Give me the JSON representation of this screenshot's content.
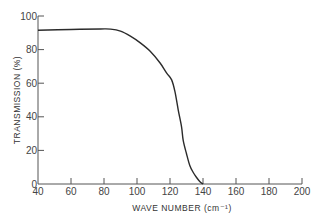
{
  "chart_data": {
    "type": "line",
    "title": "",
    "xlabel": "WAVE NUMBER (cm⁻¹)",
    "ylabel": "TRANSMISSION",
    "ylabel_unit": "(%)",
    "xlim": [
      40,
      200
    ],
    "ylim": [
      0,
      100
    ],
    "x_ticks": [
      40,
      60,
      80,
      100,
      120,
      140,
      160,
      180,
      200
    ],
    "y_ticks": [
      0,
      20,
      40,
      60,
      80,
      100
    ],
    "grid": false,
    "legend": null,
    "series": [
      {
        "name": "Transmission",
        "x": [
          40,
          60,
          78,
          84,
          90,
          96,
          102,
          108,
          114,
          118,
          121,
          123,
          125,
          127,
          128,
          130,
          132,
          134,
          136,
          138,
          140
        ],
        "values": [
          91.5,
          92,
          92.3,
          92.2,
          91,
          88,
          84,
          79,
          72,
          66,
          62,
          55,
          44,
          34,
          26,
          18,
          11,
          7,
          4,
          1.5,
          0
        ]
      }
    ]
  },
  "labels": {
    "x_axis_title": "WAVE NUMBER",
    "x_axis_unit": "(cm⁻¹)",
    "y_axis_title": "TRANSMISSION",
    "y_axis_unit": "(%)"
  }
}
